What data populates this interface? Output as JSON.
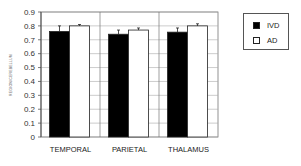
{
  "chart_data": {
    "type": "bar",
    "title": "",
    "xlabel": "",
    "ylabel": "REGION/CEREBELLUM",
    "ylim": [
      0,
      0.9
    ],
    "yticks": [
      "0",
      "0.1",
      "0.2",
      "0.3",
      "0.4",
      "0.5",
      "0.6",
      "0.7",
      "0.8",
      "0.9"
    ],
    "categories": [
      "TEMPORAL",
      "PARIETAL",
      "THALAMUS"
    ],
    "series": [
      {
        "name": "IVD",
        "color": "#000000",
        "values": [
          0.76,
          0.74,
          0.755
        ],
        "errors": [
          0.04,
          0.03,
          0.03
        ]
      },
      {
        "name": "AD",
        "color": "#ffffff",
        "values": [
          0.8,
          0.77,
          0.8
        ],
        "errors": [
          0.01,
          0.015,
          0.015
        ]
      }
    ],
    "grid": true,
    "legend_position": "right"
  },
  "legend": {
    "items": [
      {
        "label": "IVD",
        "color": "#000000"
      },
      {
        "label": "AD",
        "color": "#ffffff"
      }
    ]
  }
}
